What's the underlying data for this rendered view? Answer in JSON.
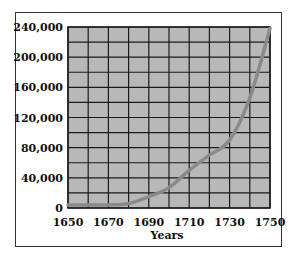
{
  "chart_data": {
    "type": "line",
    "title": "",
    "xlabel": "Years",
    "ylabel": "",
    "x": [
      1650,
      1660,
      1670,
      1680,
      1690,
      1700,
      1710,
      1720,
      1730,
      1740,
      1750
    ],
    "values": [
      4000,
      4000,
      4000,
      6000,
      15000,
      27000,
      50000,
      70000,
      90000,
      146000,
      238000
    ],
    "xlim": [
      1650,
      1750
    ],
    "ylim": [
      0,
      240000
    ],
    "x_tick_labels": [
      "1650",
      "1670",
      "1690",
      "1710",
      "1730",
      "1750"
    ],
    "y_tick_labels": [
      "0",
      "40,000",
      "80,000",
      "120,000",
      "160,000",
      "200,000",
      "240,000"
    ],
    "grid": true,
    "grid_x_step": 10,
    "grid_y_step": 20000,
    "legend": null,
    "colors": {
      "plot_background": "#b8b8b8",
      "grid": "#1a1a1a",
      "line": "#8a8a8a",
      "frame": "#333333"
    }
  }
}
